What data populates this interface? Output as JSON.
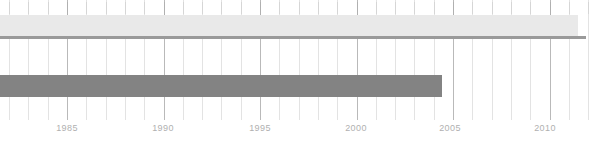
{
  "chart_data": {
    "type": "bar",
    "orientation": "horizontal",
    "title": "",
    "subtitle": "",
    "xlabel": "",
    "ylabel": "",
    "grid": true,
    "legend": null,
    "xlim": [
      1982.0,
      2012.4
    ],
    "x_tick_labels": [
      "1985",
      "1990",
      "1995",
      "2000",
      "2005",
      "2010"
    ],
    "x_ticks": [
      1985,
      1990,
      1995,
      2000,
      2005,
      2010
    ],
    "x_minor_tick_step": 1,
    "categories": [
      "Upper span",
      "Lower span"
    ],
    "series": [
      {
        "name": "Upper span",
        "start": 1982.0,
        "end": 2012.2,
        "color": "#e9e9e9",
        "edge_color": "#9a9a9a"
      },
      {
        "name": "Lower span",
        "start": 1982.0,
        "end": 2004.6,
        "color": "#838383",
        "edge_color": "#838383"
      }
    ]
  },
  "axis": {
    "labels": [
      {
        "text": "1985",
        "x_px": 67
      },
      {
        "text": "1990",
        "x_px": 163
      },
      {
        "text": "1995",
        "x_px": 260
      },
      {
        "text": "2000",
        "x_px": 356
      },
      {
        "text": "2005",
        "x_px": 450
      },
      {
        "text": "2010",
        "x_px": 545
      }
    ],
    "label_color": "#b0b0b0",
    "major_gridline_color": "#b9b9b9",
    "minor_gridline_color": "#e3e3e3"
  },
  "geometry": {
    "origin_year": 1985,
    "origin_x_px": 67,
    "px_per_year": 19.3,
    "first_year": 1982,
    "last_year": 2012,
    "grid_top_px": 0,
    "grid_height_px": 120,
    "bar_light": {
      "top_px": 15,
      "height_px": 21,
      "left_px": 0,
      "right_px": 578,
      "underline_top_px": 36,
      "underline_height_px": 3,
      "underline_right_px": 586
    },
    "bar_dark": {
      "top_px": 75,
      "height_px": 22,
      "left_px": 0,
      "right_px": 442
    }
  },
  "colors": {
    "background": "#ffffff",
    "bar_light": "#e9e9e9",
    "bar_light_edge": "#9a9a9a",
    "bar_dark": "#838383",
    "gridline_minor": "#e3e3e3",
    "gridline_major": "#b9b9b9",
    "tick_label": "#b0b0b0"
  }
}
